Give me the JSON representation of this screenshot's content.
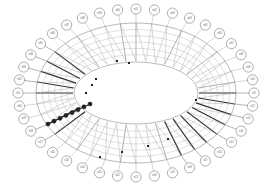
{
  "diagram": {
    "type": "radial-ring-lattice",
    "background_color": "#ffffff",
    "line_color": "#9aa0a6",
    "emphasis_color": "#2b2f33",
    "node_fill": "#ffffff",
    "node_stroke": "#6b7075",
    "highlight_fill": "#17191b",
    "geometry": {
      "canvas_width": 273,
      "canvas_height": 188,
      "center_x": 136,
      "center_y": 93,
      "outer_ring_rx": 118,
      "outer_ring_ry": 84,
      "lattice_outer_rx": 100,
      "lattice_outer_ry": 70,
      "lattice_inner_rx": 63,
      "lattice_inner_ry": 32,
      "inner_ellipse_rx": 62,
      "inner_ellipse_ry": 31,
      "node_radius": 5.1,
      "spoke_count": 40,
      "rung_count": 5
    },
    "nodes": [
      {
        "id": 0,
        "label": "n01",
        "angle": 0,
        "emphasis": "normal"
      },
      {
        "id": 1,
        "label": "n02",
        "angle": 9,
        "emphasis": "normal"
      },
      {
        "id": 2,
        "label": "n03",
        "angle": 18,
        "emphasis": "normal"
      },
      {
        "id": 3,
        "label": "n04",
        "angle": 27,
        "emphasis": "normal"
      },
      {
        "id": 4,
        "label": "n05",
        "angle": 36,
        "emphasis": "normal"
      },
      {
        "id": 5,
        "label": "n06",
        "angle": 45,
        "emphasis": "normal"
      },
      {
        "id": 6,
        "label": "n07",
        "angle": 54,
        "emphasis": "normal"
      },
      {
        "id": 7,
        "label": "n08",
        "angle": 63,
        "emphasis": "normal"
      },
      {
        "id": 8,
        "label": "n09",
        "angle": 72,
        "emphasis": "normal"
      },
      {
        "id": 9,
        "label": "n10",
        "angle": 81,
        "emphasis": "normal"
      },
      {
        "id": 10,
        "label": "n11",
        "angle": 90,
        "emphasis": "strong"
      },
      {
        "id": 11,
        "label": "n12",
        "angle": 99,
        "emphasis": "strong"
      },
      {
        "id": 12,
        "label": "n13",
        "angle": 108,
        "emphasis": "strong"
      },
      {
        "id": 13,
        "label": "n14",
        "angle": 117,
        "emphasis": "normal"
      },
      {
        "id": 14,
        "label": "n15",
        "angle": 126,
        "emphasis": "normal"
      },
      {
        "id": 15,
        "label": "n16",
        "angle": 135,
        "emphasis": "normal"
      },
      {
        "id": 16,
        "label": "n17",
        "angle": 144,
        "emphasis": "normal"
      },
      {
        "id": 17,
        "label": "n18",
        "angle": 153,
        "emphasis": "normal"
      },
      {
        "id": 18,
        "label": "n19",
        "angle": 162,
        "emphasis": "normal"
      },
      {
        "id": 19,
        "label": "n20",
        "angle": 171,
        "emphasis": "normal"
      },
      {
        "id": 20,
        "label": "n21",
        "angle": 180,
        "emphasis": "normal"
      },
      {
        "id": 21,
        "label": "n22",
        "angle": 189,
        "emphasis": "normal"
      },
      {
        "id": 22,
        "label": "n23",
        "angle": 198,
        "emphasis": "normal"
      },
      {
        "id": 23,
        "label": "n24",
        "angle": 207,
        "emphasis": "normal"
      },
      {
        "id": 24,
        "label": "n25",
        "angle": 216,
        "emphasis": "normal"
      },
      {
        "id": 25,
        "label": "n26",
        "angle": 225,
        "emphasis": "normal"
      },
      {
        "id": 26,
        "label": "n27",
        "angle": 234,
        "emphasis": "normal"
      },
      {
        "id": 27,
        "label": "n28",
        "angle": 243,
        "emphasis": "normal"
      },
      {
        "id": 28,
        "label": "n29",
        "angle": 252,
        "emphasis": "normal"
      },
      {
        "id": 29,
        "label": "n30",
        "angle": 261,
        "emphasis": "normal"
      },
      {
        "id": 30,
        "label": "n31",
        "angle": 270,
        "emphasis": "normal"
      },
      {
        "id": 31,
        "label": "n32",
        "angle": 279,
        "emphasis": "normal"
      },
      {
        "id": 32,
        "label": "n33",
        "angle": 288,
        "emphasis": "normal"
      },
      {
        "id": 33,
        "label": "n34",
        "angle": 297,
        "emphasis": "normal"
      },
      {
        "id": 34,
        "label": "n35",
        "angle": 306,
        "emphasis": "normal"
      },
      {
        "id": 35,
        "label": "n36",
        "angle": 315,
        "emphasis": "normal"
      },
      {
        "id": 36,
        "label": "n37",
        "angle": 324,
        "emphasis": "normal"
      },
      {
        "id": 37,
        "label": "n38",
        "angle": 333,
        "emphasis": "normal"
      },
      {
        "id": 38,
        "label": "n39",
        "angle": 342,
        "emphasis": "normal"
      },
      {
        "id": 39,
        "label": "n40",
        "angle": 351,
        "emphasis": "normal"
      }
    ],
    "highlight_chain": {
      "name": "highlighted-node-chain",
      "count": 8,
      "start_x": 48,
      "start_y": 124,
      "end_x": 90,
      "end_y": 104,
      "radius": 2.1
    },
    "inner_marks": [
      {
        "x": 129,
        "y": 63
      },
      {
        "x": 117,
        "y": 61
      },
      {
        "x": 96,
        "y": 79
      },
      {
        "x": 92,
        "y": 85
      },
      {
        "x": 86,
        "y": 93
      },
      {
        "x": 148,
        "y": 146
      },
      {
        "x": 122,
        "y": 152
      },
      {
        "x": 100,
        "y": 157
      },
      {
        "x": 168,
        "y": 139
      },
      {
        "x": 196,
        "y": 100
      }
    ],
    "thick_spokes": [
      10,
      11,
      12,
      13,
      14,
      15,
      16,
      17,
      30,
      31,
      32,
      33,
      34,
      26,
      27
    ]
  }
}
